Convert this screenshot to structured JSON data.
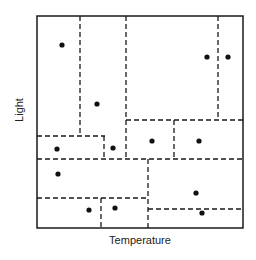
{
  "diagram": {
    "type": "kd-tree-partition",
    "xlabel": "Temperature",
    "ylabel": "Light",
    "colors": {
      "line": "#1a1a1a",
      "point": "#111111",
      "background": "#ffffff"
    },
    "frame": {
      "x1": 37,
      "y1": 16,
      "x2": 243,
      "y2": 228
    },
    "splits": [
      {
        "orientation": "vertical",
        "x": 80,
        "y1": 16,
        "y2": 136
      },
      {
        "orientation": "vertical",
        "x": 126,
        "y1": 16,
        "y2": 159
      },
      {
        "orientation": "vertical",
        "x": 218,
        "y1": 16,
        "y2": 120
      },
      {
        "orientation": "horizontal",
        "y": 120,
        "x1": 126,
        "x2": 243
      },
      {
        "orientation": "horizontal",
        "y": 136,
        "x1": 37,
        "x2": 105
      },
      {
        "orientation": "vertical",
        "x": 104,
        "y1": 136,
        "y2": 159
      },
      {
        "orientation": "vertical",
        "x": 174,
        "y1": 120,
        "y2": 159
      },
      {
        "orientation": "horizontal",
        "y": 159,
        "x1": 37,
        "x2": 243
      },
      {
        "orientation": "vertical",
        "x": 148,
        "y1": 159,
        "y2": 228
      },
      {
        "orientation": "horizontal",
        "y": 198,
        "x1": 37,
        "x2": 148
      },
      {
        "orientation": "vertical",
        "x": 101,
        "y1": 198,
        "y2": 228
      },
      {
        "orientation": "horizontal",
        "y": 209,
        "x1": 148,
        "x2": 243
      }
    ],
    "points": [
      {
        "x": 62,
        "y": 45
      },
      {
        "x": 97,
        "y": 104
      },
      {
        "x": 207,
        "y": 57
      },
      {
        "x": 228,
        "y": 57
      },
      {
        "x": 57,
        "y": 149
      },
      {
        "x": 113,
        "y": 148
      },
      {
        "x": 152,
        "y": 141
      },
      {
        "x": 199,
        "y": 141
      },
      {
        "x": 58,
        "y": 174
      },
      {
        "x": 89,
        "y": 210
      },
      {
        "x": 115,
        "y": 208
      },
      {
        "x": 196,
        "y": 193
      },
      {
        "x": 202,
        "y": 213
      }
    ]
  }
}
